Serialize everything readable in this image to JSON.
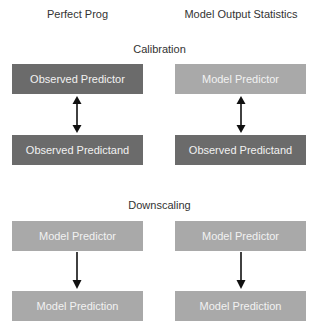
{
  "columns": {
    "left": {
      "title": "Perfect Prog"
    },
    "right": {
      "title": "Model Output Statistics"
    }
  },
  "sections": {
    "calibration": {
      "title": "Calibration",
      "left": {
        "top": {
          "label": "Observed Predictor",
          "shade": "dark"
        },
        "bottom": {
          "label": "Observed Predictand",
          "shade": "dark"
        },
        "connector": "double-arrow"
      },
      "right": {
        "top": {
          "label": "Model Predictor",
          "shade": "light"
        },
        "bottom": {
          "label": "Observed Predictand",
          "shade": "dark"
        },
        "connector": "double-arrow"
      }
    },
    "downscaling": {
      "title": "Downscaling",
      "left": {
        "top": {
          "label": "Model Predictor",
          "shade": "light"
        },
        "bottom": {
          "label": "Model Prediction",
          "shade": "light"
        },
        "connector": "down-arrow"
      },
      "right": {
        "top": {
          "label": "Model Predictor",
          "shade": "light"
        },
        "bottom": {
          "label": "Model Prediction",
          "shade": "light"
        },
        "connector": "down-arrow"
      }
    }
  },
  "colors": {
    "dark_box": "#6b6b6b",
    "light_box": "#a9a9a9",
    "box_text": "#f2f2f2",
    "heading_text": "#333333",
    "arrow": "#111111"
  }
}
